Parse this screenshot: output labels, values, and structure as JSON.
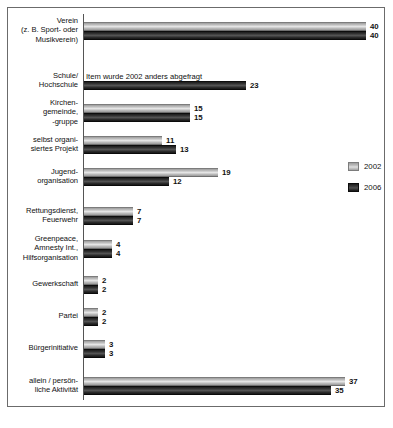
{
  "chart_data": {
    "type": "bar",
    "orientation": "horizontal",
    "title": "",
    "xlabel": "",
    "ylabel": "",
    "xlim": [
      0,
      42
    ],
    "grid": false,
    "legend_position": "right",
    "categories": [
      "Verein\n(z. B. Sport- oder\nMusikverein)",
      "Schule/\nHochschule",
      "Kirchen-\ngemeinde,\n-gruppe",
      "selbst organi-\nsiertes Projekt",
      "Jugend-\norganisation",
      "Rettungsdienst,\nFeuerwehr",
      "Greenpeace,\nAmnesty Int.,\nHilfsorganisation",
      "Gewerkschaft",
      "Partei",
      "Bürgerinitiative",
      "allein / persön-\nliche Aktivität"
    ],
    "series": [
      {
        "name": "2002",
        "color": "#c9c9c9",
        "values": [
          40,
          null,
          15,
          11,
          19,
          7,
          4,
          2,
          2,
          3,
          37
        ]
      },
      {
        "name": "2006",
        "color": "#1f1f1f",
        "values": [
          40,
          23,
          15,
          13,
          12,
          7,
          4,
          2,
          2,
          3,
          35
        ]
      }
    ],
    "annotations": [
      {
        "category_index": 1,
        "series": "2002",
        "text": "Item wurde 2002 anders abgefragt"
      }
    ]
  },
  "categories": [
    {
      "label_lines": [
        "Verein",
        "(z. B. Sport- oder",
        "Musikverein)"
      ],
      "bars": [
        {
          "series": "2002",
          "value": 40,
          "value_label": "40"
        },
        {
          "series": "2006",
          "value": 40,
          "value_label": "40"
        }
      ]
    },
    {
      "label_lines": [
        "Schule/",
        "Hochschule"
      ],
      "bars": [
        {
          "series": "2002",
          "value": null,
          "value_label": "",
          "note": "Item wurde 2002 anders abgefragt"
        },
        {
          "series": "2006",
          "value": 23,
          "value_label": "23"
        }
      ]
    },
    {
      "label_lines": [
        "Kirchen-",
        "gemeinde,",
        "-gruppe"
      ],
      "bars": [
        {
          "series": "2002",
          "value": 15,
          "value_label": "15"
        },
        {
          "series": "2006",
          "value": 15,
          "value_label": "15"
        }
      ]
    },
    {
      "label_lines": [
        "selbst organi-",
        "siertes Projekt"
      ],
      "bars": [
        {
          "series": "2002",
          "value": 11,
          "value_label": "11"
        },
        {
          "series": "2006",
          "value": 13,
          "value_label": "13"
        }
      ]
    },
    {
      "label_lines": [
        "Jugend-",
        "organisation"
      ],
      "bars": [
        {
          "series": "2002",
          "value": 19,
          "value_label": "19"
        },
        {
          "series": "2006",
          "value": 12,
          "value_label": "12"
        }
      ]
    },
    {
      "label_lines": [
        "Rettungsdienst,",
        "Feuerwehr"
      ],
      "bars": [
        {
          "series": "2002",
          "value": 7,
          "value_label": "7"
        },
        {
          "series": "2006",
          "value": 7,
          "value_label": "7"
        }
      ]
    },
    {
      "label_lines": [
        "Greenpeace,",
        "Amnesty Int.,",
        "Hilfsorganisation"
      ],
      "bars": [
        {
          "series": "2002",
          "value": 4,
          "value_label": "4"
        },
        {
          "series": "2006",
          "value": 4,
          "value_label": "4"
        }
      ]
    },
    {
      "label_lines": [
        "Gewerkschaft"
      ],
      "bars": [
        {
          "series": "2002",
          "value": 2,
          "value_label": "2"
        },
        {
          "series": "2006",
          "value": 2,
          "value_label": "2"
        }
      ]
    },
    {
      "label_lines": [
        "Partei"
      ],
      "bars": [
        {
          "series": "2002",
          "value": 2,
          "value_label": "2"
        },
        {
          "series": "2006",
          "value": 2,
          "value_label": "2"
        }
      ]
    },
    {
      "label_lines": [
        "Bürgerinitiative"
      ],
      "bars": [
        {
          "series": "2002",
          "value": 3,
          "value_label": "3"
        },
        {
          "series": "2006",
          "value": 3,
          "value_label": "3"
        }
      ]
    },
    {
      "label_lines": [
        "allein / persön-",
        "liche Aktivität"
      ],
      "bars": [
        {
          "series": "2002",
          "value": 37,
          "value_label": "37"
        },
        {
          "series": "2006",
          "value": 35,
          "value_label": "35"
        }
      ]
    }
  ],
  "legend": {
    "entries": [
      {
        "label": "2002",
        "series": "2002"
      },
      {
        "label": "2006",
        "series": "2006"
      }
    ]
  },
  "caption": {
    "text": ""
  },
  "layout": {
    "px_per_unit": 7.05,
    "bar_height": 9,
    "group_tops": [
      14,
      64,
      96,
      128,
      160,
      199,
      232,
      268,
      300,
      332,
      369
    ]
  }
}
